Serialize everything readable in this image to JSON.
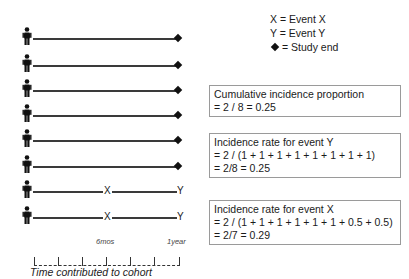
{
  "legend": {
    "items": [
      {
        "symbol": "X",
        "text": "X = Event X"
      },
      {
        "symbol": "Y",
        "text": "Y = Event Y"
      },
      {
        "symbol": "diamond-icon",
        "text": "= Study end"
      }
    ]
  },
  "timeline": {
    "rows": [
      {
        "end": "diamond"
      },
      {
        "end": "diamond"
      },
      {
        "end": "diamond"
      },
      {
        "end": "diamond"
      },
      {
        "end": "diamond"
      },
      {
        "end": "diamond"
      },
      {
        "event_mid": "X",
        "end": "Y"
      },
      {
        "event_mid": "X",
        "end": "Y"
      }
    ],
    "axis": {
      "label_mid": "6mos",
      "label_end": "1year",
      "title": "Time contributed to cohort"
    }
  },
  "boxes": {
    "cumulative": {
      "line1": "Cumulative incidence proportion",
      "line2": "= 2 / 8 = 0.25"
    },
    "rate_y": {
      "line1": "Incidence rate for event Y",
      "line2": "=  2 / (1 + 1 + 1 + 1 + 1 + 1 + 1 + 1)",
      "line3": "= 2/8 = 0.25"
    },
    "rate_x": {
      "line1": "Incidence rate for event X",
      "line2": "=  2 / (1 + 1 + 1 + 1 + 1 + 1 + 0.5 + 0.5)",
      "line3": "= 2/7 = 0.29"
    }
  }
}
